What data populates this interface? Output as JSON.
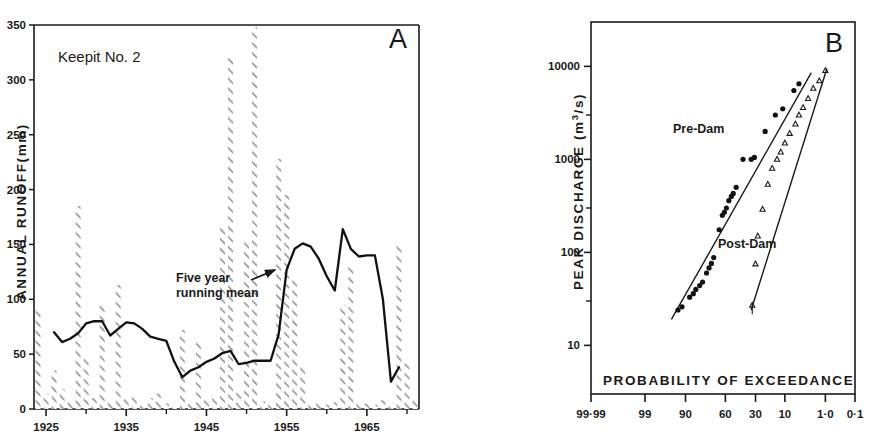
{
  "figure": {
    "background": "#ffffff",
    "ink_color": "#1a1a1a",
    "hatch_color": "#8c8c8c"
  },
  "panelA": {
    "letter": "A",
    "site_title": "Keepit No. 2",
    "ylabel": "ANNUAL RUNOFF(mm)",
    "annotation_line1": "Five year",
    "annotation_line2": "running mean",
    "y_ticks": [
      0,
      50,
      100,
      150,
      200,
      250,
      300,
      350
    ],
    "y_tick_labels": [
      "0",
      "50",
      "100",
      "150",
      "200",
      "250",
      "300",
      "350"
    ],
    "x_major_ticks": [
      1925,
      1935,
      1945,
      1955,
      1965
    ],
    "x_major_labels": [
      "1925",
      "1935",
      "1945",
      "1955",
      "1965"
    ],
    "x_minor_ticks": [
      1930,
      1940,
      1950,
      1960,
      1970
    ]
  },
  "panelB": {
    "letter": "B",
    "ylabel_prefix": "PEAK DISCHARGE (m",
    "ylabel_sup": "3",
    "ylabel_suffix": "/s)",
    "ylabel_plain": "PEAK DISCHARGE (m3/s)",
    "xlabel": "PROBABILITY OF EXCEEDANCE",
    "y_major_labels": [
      "10000",
      "1000",
      "100",
      "10"
    ],
    "x_tick_labels": [
      "99·99",
      "99",
      "90",
      "60",
      "30",
      "10",
      "1·0",
      "0·1"
    ],
    "series_labels": {
      "pre": "Pre-Dam",
      "post": "Post-Dam"
    }
  },
  "chart_data": [
    {
      "type": "bar",
      "panel": "A",
      "title": "Keepit No. 2",
      "xlabel": "",
      "ylabel": "ANNUAL RUNOFF(mm)",
      "ylim": [
        0,
        350
      ],
      "xlim": [
        1923.5,
        1971.5
      ],
      "grid": false,
      "categories": [
        1924,
        1925,
        1926,
        1927,
        1928,
        1929,
        1930,
        1931,
        1932,
        1933,
        1934,
        1935,
        1936,
        1937,
        1938,
        1939,
        1940,
        1941,
        1942,
        1943,
        1944,
        1945,
        1946,
        1947,
        1948,
        1949,
        1950,
        1951,
        1952,
        1953,
        1954,
        1955,
        1956,
        1957,
        1958,
        1959,
        1960,
        1961,
        1962,
        1963,
        1964,
        1965,
        1966,
        1967,
        1968,
        1969,
        1970,
        1971
      ],
      "values": [
        92,
        14,
        35,
        18,
        8,
        185,
        48,
        10,
        96,
        8,
        113,
        10,
        12,
        6,
        10,
        14,
        5,
        4,
        72,
        6,
        62,
        8,
        10,
        165,
        320,
        15,
        152,
        348,
        7,
        6,
        228,
        195,
        120,
        40,
        5,
        8,
        4,
        6,
        95,
        132,
        6,
        5,
        4,
        8,
        6,
        150,
        42,
        10
      ],
      "series": [
        {
          "name": "Annual runoff (mm)",
          "type": "bar",
          "values": [
            92,
            14,
            35,
            18,
            8,
            185,
            48,
            10,
            96,
            8,
            113,
            10,
            12,
            6,
            10,
            14,
            5,
            4,
            72,
            6,
            62,
            8,
            10,
            165,
            320,
            15,
            152,
            348,
            7,
            6,
            228,
            195,
            120,
            40,
            5,
            8,
            4,
            6,
            95,
            132,
            6,
            5,
            4,
            8,
            6,
            150,
            42,
            10
          ]
        },
        {
          "name": "Five year running mean",
          "type": "line",
          "x": [
            1926,
            1927,
            1928,
            1929,
            1930,
            1931,
            1932,
            1933,
            1934,
            1935,
            1936,
            1937,
            1938,
            1939,
            1940,
            1941,
            1942,
            1943,
            1944,
            1945,
            1946,
            1947,
            1948,
            1949,
            1950,
            1951,
            1952,
            1953,
            1954,
            1955,
            1956,
            1957,
            1958,
            1959,
            1960,
            1961,
            1962,
            1963,
            1964,
            1965,
            1966,
            1967,
            1968,
            1969
          ],
          "values": [
            70,
            61,
            64,
            69,
            78,
            80,
            80,
            67,
            73,
            79,
            78,
            73,
            66,
            64,
            62,
            43,
            29,
            35,
            38,
            43,
            46,
            51,
            53,
            41,
            42,
            44,
            44,
            44,
            68,
            127,
            146,
            151,
            148,
            137,
            121,
            108,
            164,
            146,
            139,
            140,
            140,
            100,
            25,
            38
          ]
        }
      ]
    },
    {
      "type": "scatter",
      "panel": "B",
      "title": "",
      "xlabel": "PROBABILITY OF EXCEEDANCE",
      "ylabel": "PEAK DISCHARGE (m3/s)",
      "yscale": "log",
      "ylim": [
        3,
        30000
      ],
      "xscale": "probability",
      "xlim_percent": [
        99.99,
        0.1
      ],
      "grid": false,
      "series": [
        {
          "name": "Pre-Dam",
          "marker": "filled-circle",
          "points": [
            {
              "p": 93.0,
              "q": 24
            },
            {
              "p": 91.5,
              "q": 26
            },
            {
              "p": 88.0,
              "q": 33
            },
            {
              "p": 86.0,
              "q": 36
            },
            {
              "p": 84.5,
              "q": 40
            },
            {
              "p": 82.0,
              "q": 44
            },
            {
              "p": 80.0,
              "q": 48
            },
            {
              "p": 77.0,
              "q": 60
            },
            {
              "p": 75.0,
              "q": 68
            },
            {
              "p": 73.0,
              "q": 76
            },
            {
              "p": 71.0,
              "q": 88
            },
            {
              "p": 66.0,
              "q": 175
            },
            {
              "p": 63.0,
              "q": 250
            },
            {
              "p": 61.0,
              "q": 270
            },
            {
              "p": 59.0,
              "q": 300
            },
            {
              "p": 56.5,
              "q": 360
            },
            {
              "p": 54.0,
              "q": 400
            },
            {
              "p": 52.0,
              "q": 430
            },
            {
              "p": 49.0,
              "q": 500
            },
            {
              "p": 42.0,
              "q": 1000
            },
            {
              "p": 34.0,
              "q": 1000
            },
            {
              "p": 31.0,
              "q": 1050
            },
            {
              "p": 22.0,
              "q": 2000
            },
            {
              "p": 15.0,
              "q": 3000
            },
            {
              "p": 11.0,
              "q": 3500
            },
            {
              "p": 6.5,
              "q": 5500
            },
            {
              "p": 5.0,
              "q": 6500
            }
          ],
          "fit_line": {
            "p_from": 95.0,
            "q_from": 19,
            "p_to": 2.5,
            "q_to": 8500
          }
        },
        {
          "name": "Post-Dam",
          "marker": "open-triangle",
          "points": [
            {
              "p": 33.0,
              "q": 27
            },
            {
              "p": 30.0,
              "q": 75
            },
            {
              "p": 28.0,
              "q": 150
            },
            {
              "p": 24.0,
              "q": 290
            },
            {
              "p": 20.0,
              "q": 540
            },
            {
              "p": 17.0,
              "q": 800
            },
            {
              "p": 14.0,
              "q": 1000
            },
            {
              "p": 12.0,
              "q": 1200
            },
            {
              "p": 10.0,
              "q": 1500
            },
            {
              "p": 8.0,
              "q": 1900
            },
            {
              "p": 6.0,
              "q": 2400
            },
            {
              "p": 5.0,
              "q": 3000
            },
            {
              "p": 4.0,
              "q": 3600
            },
            {
              "p": 3.0,
              "q": 4500
            },
            {
              "p": 2.2,
              "q": 5800
            },
            {
              "p": 1.5,
              "q": 7000
            },
            {
              "p": 1.0,
              "q": 9000
            }
          ],
          "fit_line": {
            "p_from": 34.0,
            "q_from": 24,
            "p_to": 0.9,
            "q_to": 9500
          }
        }
      ]
    }
  ]
}
